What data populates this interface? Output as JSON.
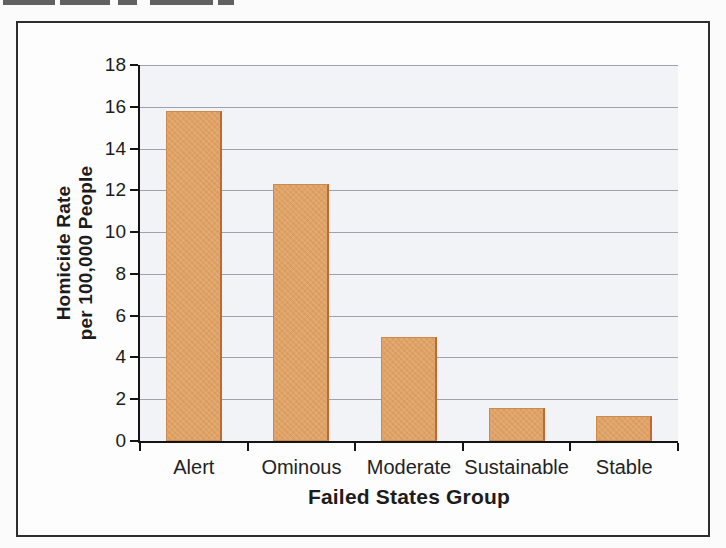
{
  "chart_data": {
    "type": "bar",
    "categories": [
      "Alert",
      "Ominous",
      "Moderate",
      "Sustainable",
      "Stable"
    ],
    "values": [
      15.8,
      12.3,
      5.0,
      1.6,
      1.2
    ],
    "title": "",
    "xlabel": "Failed States Group",
    "ylabel_lines": [
      "Homicide Rate",
      "per 100,000 People"
    ],
    "ylim": [
      0,
      18
    ],
    "ytick_step": 2,
    "ytick_labels": [
      "0",
      "2",
      "4",
      "6",
      "8",
      "10",
      "12",
      "14",
      "16",
      "18"
    ],
    "grid": true,
    "legend_position": "none",
    "colors": {
      "bar_fill": "#e0a264",
      "bar_edge": "#cd8a4a",
      "bar_edge_right": "#bf6a33",
      "plot_background": "#f1f3f7",
      "gridline": "#9ba3b0",
      "axis": "#141414",
      "text": "#1c1c1c",
      "frame_border": "#2e2e2e"
    }
  }
}
